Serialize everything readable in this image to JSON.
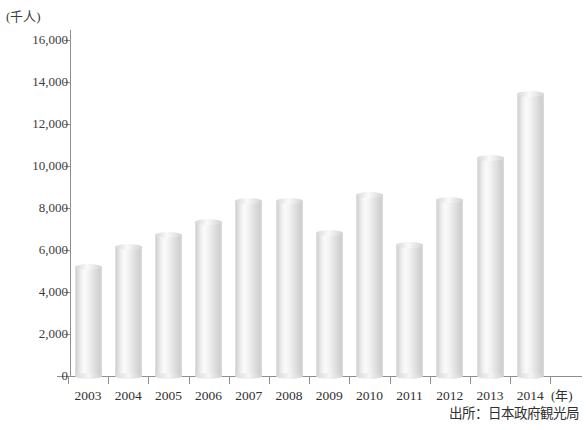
{
  "chart_data": {
    "type": "bar",
    "title": "",
    "subtitle": "",
    "xlabel": "(年)",
    "ylabel": "(千人)",
    "categories": [
      "2003",
      "2004",
      "2005",
      "2006",
      "2007",
      "2008",
      "2009",
      "2010",
      "2011",
      "2012",
      "2013",
      "2014"
    ],
    "values": [
      5212,
      6138,
      6728,
      7334,
      8347,
      8351,
      6790,
      8611,
      6219,
      8358,
      10364,
      13413
    ],
    "ylim": [
      0,
      16000
    ],
    "ytick_values": [
      16000,
      14000,
      12000,
      10000,
      8000,
      6000,
      4000,
      2000,
      0
    ],
    "ytick_labels": [
      "16,000",
      "14,000",
      "12,000",
      "10,000",
      "8,000",
      "6,000",
      "4,000",
      "2,000",
      "0"
    ],
    "grid": false,
    "legend": null,
    "legend_position": "none",
    "bar_style": "cylinder",
    "series": [
      {
        "name": "訪日外客数",
        "values": [
          5212,
          6138,
          6728,
          7334,
          8347,
          8351,
          6790,
          8611,
          6219,
          8358,
          10364,
          13413
        ]
      }
    ],
    "annotations": [
      "出所：日本政府観光局"
    ]
  },
  "axes": {
    "y_unit_caption": "(千人)",
    "x_unit_caption": "(年)"
  },
  "footer": {
    "source": "出所：日本政府観光局"
  },
  "colors": {
    "axis": "#8e8e8e",
    "text": "#303030",
    "bar_light": "#fbfbfb",
    "bar_mid": "#e4e4e4",
    "bar_dark": "#cfcfcf",
    "background": "#ffffff"
  }
}
